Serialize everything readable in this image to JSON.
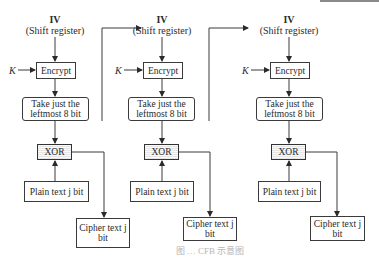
{
  "diagram": {
    "stages": [
      {
        "iv_label": "IV",
        "iv_sub": "(Shift register)",
        "key_label": "K",
        "encrypt_label": "Encrypt",
        "select_label_1": "Take just the",
        "select_label_2": "leftmost 8 bit",
        "xor_label": "XOR",
        "plain_label": "Plain text j bit",
        "cipher_label_1": "Cipher text j",
        "cipher_label_2": "bit"
      },
      {
        "iv_label": "IV",
        "iv_sub": "(Shift register)",
        "key_label": "K",
        "encrypt_label": "Encrypt",
        "select_label_1": "Take just the",
        "select_label_2": "leftmost 8 bit",
        "xor_label": "XOR",
        "plain_label": "Plain text j bit",
        "cipher_label_1": "Cipher text j",
        "cipher_label_2": "bit"
      },
      {
        "iv_label": "IV",
        "iv_sub": "(Shift register)",
        "key_label": "K",
        "encrypt_label": "Encrypt",
        "select_label_1": "Take just the",
        "select_label_2": "leftmost 8 bit",
        "xor_label": "XOR",
        "plain_label": "Plain text j bit",
        "cipher_label_1": "Cipher text j",
        "cipher_label_2": "bit"
      }
    ],
    "edges": [
      {
        "from": "iv-1",
        "to": "encrypt-1"
      },
      {
        "from": "key-1",
        "to": "encrypt-1"
      },
      {
        "from": "encrypt-1",
        "to": "select-1"
      },
      {
        "from": "select-1",
        "to": "xor-1"
      },
      {
        "from": "plain-1",
        "to": "xor-1"
      },
      {
        "from": "xor-1",
        "to": "cipher-1"
      },
      {
        "from": "cipher-1",
        "to": "iv-2",
        "label": "feedback"
      },
      {
        "from": "iv-2",
        "to": "encrypt-2"
      },
      {
        "from": "key-2",
        "to": "encrypt-2"
      },
      {
        "from": "encrypt-2",
        "to": "select-2"
      },
      {
        "from": "select-2",
        "to": "xor-2"
      },
      {
        "from": "plain-2",
        "to": "xor-2"
      },
      {
        "from": "xor-2",
        "to": "cipher-2"
      },
      {
        "from": "cipher-2",
        "to": "iv-3",
        "label": "feedback"
      },
      {
        "from": "iv-3",
        "to": "encrypt-3"
      },
      {
        "from": "key-3",
        "to": "encrypt-3"
      },
      {
        "from": "encrypt-3",
        "to": "select-3"
      },
      {
        "from": "select-3",
        "to": "xor-3"
      },
      {
        "from": "plain-3",
        "to": "xor-3"
      },
      {
        "from": "xor-3",
        "to": "cipher-3"
      }
    ],
    "caption": "图 … CFB 示意图"
  },
  "colors": {
    "line": "#3a3a3a",
    "xor_fill": "#eeeeee",
    "caption": "#b5b5b5"
  }
}
